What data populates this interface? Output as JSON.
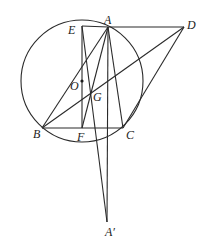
{
  "diagram": {
    "type": "geometry",
    "circle": {
      "name": "O",
      "center": [
        82,
        81
      ],
      "radius": 61
    },
    "points": {
      "A": {
        "label": "A",
        "x": 108,
        "y": 27,
        "label_dx": -4,
        "label_dy": -3
      },
      "B": {
        "label": "B",
        "x": 42,
        "y": 128,
        "label_dx": -9,
        "label_dy": 10
      },
      "C": {
        "label": "C",
        "x": 123,
        "y": 128,
        "label_dx": 3,
        "label_dy": 11
      },
      "D": {
        "label": "D",
        "x": 184,
        "y": 27,
        "label_dx": 3,
        "label_dy": 2
      },
      "E": {
        "label": "E",
        "x": 82,
        "y": 26,
        "label_dx": -14,
        "label_dy": 8
      },
      "F": {
        "label": "F",
        "x": 82,
        "y": 128,
        "label_dx": -5,
        "label_dy": 13
      },
      "G": {
        "label": "G",
        "x": 91,
        "y": 94,
        "label_dx": 2,
        "label_dy": 7
      },
      "O": {
        "label": "O",
        "x": 82,
        "y": 81,
        "label_dx": -12,
        "label_dy": 9
      },
      "A'": {
        "label": "A′",
        "x": 107,
        "y": 222,
        "label_dx": -2,
        "label_dy": 14
      }
    },
    "segments": [
      [
        "E",
        "A"
      ],
      [
        "A",
        "D"
      ],
      [
        "E",
        "F"
      ],
      [
        "E",
        "A'"
      ],
      [
        "A",
        "B"
      ],
      [
        "A",
        "F"
      ],
      [
        "A",
        "A'"
      ],
      [
        "A",
        "C"
      ],
      [
        "B",
        "C"
      ],
      [
        "B",
        "D"
      ],
      [
        "C",
        "D"
      ]
    ],
    "marked_points": [
      "O"
    ]
  }
}
